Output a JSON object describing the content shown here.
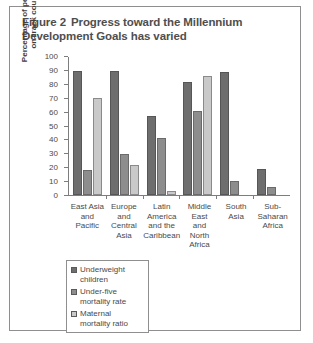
{
  "figure": {
    "number": "Figure 2",
    "title": "Progress toward the Millennium Development Goals has varied"
  },
  "chart_data": {
    "type": "bar",
    "xlabel": "",
    "ylabel": "Percentage of people in on-track country",
    "ylim": [
      0,
      100
    ],
    "ytick_step": 10,
    "yticks": [
      0,
      10,
      20,
      30,
      40,
      50,
      60,
      70,
      80,
      90,
      100
    ],
    "grid": false,
    "legend_position": "bottom-left",
    "categories": [
      "East Asia and Pacific",
      "Europe and Central Asia",
      "Latin America and the Caribbean",
      "Middle East and North Africa",
      "South Asia",
      "Sub-Saharan Africa"
    ],
    "category_lines": [
      [
        "East Asia",
        "and",
        "Pacific"
      ],
      [
        "Europe",
        "and",
        "Central",
        "Asia"
      ],
      [
        "Latin",
        "America",
        "and the",
        "Caribbean"
      ],
      [
        "Middle",
        "East",
        "and North",
        "Africa"
      ],
      [
        "South",
        "Asia"
      ],
      [
        "Sub-",
        "Saharan",
        "Africa"
      ]
    ],
    "series": [
      {
        "name": "Underweight children",
        "color": "#6e6e6e",
        "values": [
          90,
          90,
          57,
          82,
          89,
          19
        ]
      },
      {
        "name": "Under-five mortality rate",
        "color": "#8d8d8d",
        "values": [
          18,
          30,
          41,
          61,
          10,
          6
        ]
      },
      {
        "name": "Maternal mortality ratio",
        "color": "#c9c9c9",
        "values": [
          70,
          22,
          3,
          86,
          0,
          0
        ]
      }
    ]
  },
  "legend": {
    "items": [
      {
        "label_line1": "Underweight",
        "label_line2": "children"
      },
      {
        "label_line1": "Under-five",
        "label_line2": "mortality rate"
      },
      {
        "label_line1": "Maternal",
        "label_line2": "mortality ratio"
      }
    ]
  }
}
